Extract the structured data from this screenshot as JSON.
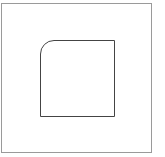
{
  "diagram": {
    "outer_frame": {
      "stroke": "#9a9a9a"
    },
    "shape": {
      "type": "square-with-rounded-top-left-corner",
      "stroke": "#444444",
      "fill": "#ffffff"
    }
  }
}
